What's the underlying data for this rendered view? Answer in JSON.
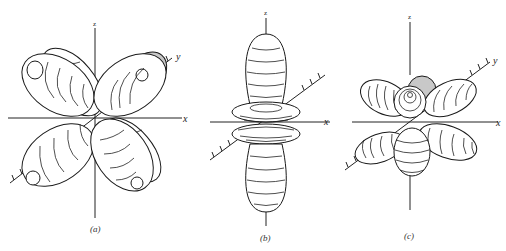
{
  "figure": {
    "panels": [
      {
        "id": "a",
        "caption": "(a)",
        "axis_labels": {
          "z": "z",
          "x": "x",
          "y": "y"
        },
        "description": "Four-lobed (cloverleaf) orbital with banded lobes in the xz plane, one back lobe shaded"
      },
      {
        "id": "b",
        "caption": "(b)",
        "axis_labels": {
          "z": "z",
          "x": "x"
        },
        "description": "Dumbbell along z with a double torus ring around the xy plane"
      },
      {
        "id": "c",
        "caption": "(c)",
        "axis_labels": {
          "z": "z",
          "x": "x",
          "y": "y"
        },
        "description": "Multi-lobed orbital with six banded lobes clustered around the origin, one shaded"
      }
    ],
    "colors": {
      "line": "#1a1a1a",
      "shade": "#c8c8c8",
      "background": "#ffffff"
    }
  }
}
